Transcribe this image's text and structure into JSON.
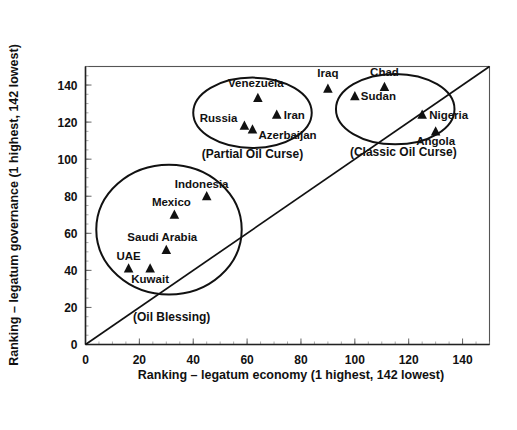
{
  "chart_data": {
    "type": "scatter",
    "title": "",
    "xlabel": "Ranking – legatum economy (1 highest, 142 lowest)",
    "ylabel": "Ranking – legatum governance (1 highest, 142 lowest)",
    "xlim": [
      0,
      150
    ],
    "ylim": [
      0,
      150
    ],
    "xticks": [
      0,
      20,
      40,
      60,
      80,
      100,
      120,
      140
    ],
    "yticks": [
      0,
      20,
      40,
      60,
      80,
      100,
      120,
      140
    ],
    "grid": false,
    "legend": "none",
    "marker_shape": "triangle",
    "marker_color": "#111111",
    "reference_line": {
      "type": "diagonal",
      "description": "45-degree line y = x",
      "from": [
        0,
        0
      ],
      "to": [
        150,
        150
      ]
    },
    "points": [
      {
        "name": "Venezuela",
        "x": 64,
        "y": 133,
        "label_dx": -2,
        "label_dy": -11,
        "label_anchor": "middle"
      },
      {
        "name": "Iraq",
        "x": 90,
        "y": 138,
        "label_dx": 0,
        "label_dy": -12,
        "label_anchor": "middle"
      },
      {
        "name": "Iran",
        "x": 71,
        "y": 124,
        "label_dx": 7,
        "label_dy": 4,
        "label_anchor": "start"
      },
      {
        "name": "Russia",
        "x": 59,
        "y": 118,
        "label_dx": -7,
        "label_dy": -4,
        "label_anchor": "end"
      },
      {
        "name": "Azerbaijan",
        "x": 62,
        "y": 116,
        "label_dx": 6,
        "label_dy": 9,
        "label_anchor": "start"
      },
      {
        "name": "Chad",
        "x": 111,
        "y": 139,
        "label_dx": 0,
        "label_dy": -11,
        "label_anchor": "middle"
      },
      {
        "name": "Sudan",
        "x": 100,
        "y": 134,
        "label_dx": 6,
        "label_dy": 4,
        "label_anchor": "start"
      },
      {
        "name": "Nigeria",
        "x": 125,
        "y": 124,
        "label_dx": 7,
        "label_dy": 4,
        "label_anchor": "start"
      },
      {
        "name": "Angola",
        "x": 130,
        "y": 115,
        "label_dx": 0,
        "label_dy": 14,
        "label_anchor": "middle"
      },
      {
        "name": "Indonesia",
        "x": 45,
        "y": 80,
        "label_dx": -5,
        "label_dy": -8,
        "label_anchor": "middle"
      },
      {
        "name": "Mexico",
        "x": 33,
        "y": 70,
        "label_dx": -3,
        "label_dy": -9,
        "label_anchor": "middle"
      },
      {
        "name": "Saudi Arabia",
        "x": 30,
        "y": 51,
        "label_dx": -4,
        "label_dy": -9,
        "label_anchor": "middle"
      },
      {
        "name": "UAE",
        "x": 16,
        "y": 41,
        "label_dx": 0,
        "label_dy": -9,
        "label_anchor": "middle"
      },
      {
        "name": "Kuwait",
        "x": 24,
        "y": 41,
        "label_dx": 0,
        "label_dy": 14,
        "label_anchor": "middle"
      }
    ],
    "clusters": [
      {
        "label": "(Partial Oil Curse)",
        "shape": "ellipse",
        "cx": 62,
        "cy": 125,
        "rx": 22,
        "ry": 19,
        "label_x": 62,
        "label_y": 103
      },
      {
        "label": "(Classic Oil Curse)",
        "shape": "ellipse",
        "cx": 115,
        "cy": 127,
        "rx": 22,
        "ry": 19,
        "label_x": 118,
        "label_y": 104
      },
      {
        "label": "(Oil Blessing)",
        "shape": "ellipse",
        "cx": 31,
        "cy": 62,
        "rx": 27,
        "ry": 35,
        "label_x": 32,
        "label_y": 15
      }
    ]
  }
}
